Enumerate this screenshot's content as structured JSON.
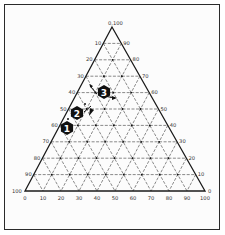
{
  "diagram": {
    "type": "ternary",
    "grid_step": 10,
    "apex_label": "0,100",
    "left_axis_labels": [
      "10",
      "20",
      "30",
      "40",
      "50",
      "60",
      "70",
      "80",
      "90"
    ],
    "left_corner_label": "100",
    "right_axis_labels": [
      "90",
      "80",
      "70",
      "60",
      "50",
      "40",
      "30",
      "20",
      "10"
    ],
    "right_corner_label": "0",
    "bottom_axis_labels": [
      "0",
      "10",
      "20",
      "30",
      "40",
      "50",
      "60",
      "70",
      "80",
      "90",
      "100"
    ],
    "markers": [
      {
        "id": "1",
        "label": "1"
      },
      {
        "id": "2",
        "label": "2"
      },
      {
        "id": "3",
        "label": "3"
      }
    ],
    "colors": {
      "line": "#1a1a1a",
      "grid": "#3a3a3a",
      "marker_fill": "#111111",
      "marker_text": "#ffffff",
      "background": "#fcfcfc"
    }
  }
}
